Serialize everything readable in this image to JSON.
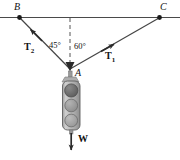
{
  "figure": {
    "background_color": "#ffffff",
    "line_color": "#3a3a3a",
    "text_color": "#111111",
    "width": 180,
    "height": 160
  },
  "points": {
    "B": {
      "label": "B",
      "x": 19,
      "y": 17
    },
    "C": {
      "label": "C",
      "x": 160,
      "y": 17
    },
    "A": {
      "label": "A",
      "x": 70,
      "y": 70
    }
  },
  "angles": {
    "left": {
      "label": "45°",
      "value": 45,
      "between": "dashed vertical and cable AB"
    },
    "right": {
      "label": "60°",
      "value": 60,
      "between": "dashed vertical and cable AC"
    }
  },
  "vectors": {
    "t2": {
      "label": "T",
      "subscript": "2",
      "direction": "up-left toward B"
    },
    "t1": {
      "label": "T",
      "subscript": "1",
      "direction": "up-right toward C"
    },
    "w": {
      "label": "W",
      "subscript": "",
      "direction": "straight down"
    }
  },
  "traffic_light": {
    "lights": [
      {
        "name": "top-light",
        "shade": "#6e6e6e"
      },
      {
        "name": "middle-light",
        "shade": "#9a9a9a"
      },
      {
        "name": "bottom-light",
        "shade": "#a6a6a6"
      }
    ],
    "body_color": "#b9b9b9"
  },
  "guides": {
    "horizontal_support": "solid horizontal ceiling/wire line through B and C",
    "vertical_dashed": "dashed vertical reference line from support down to A"
  }
}
